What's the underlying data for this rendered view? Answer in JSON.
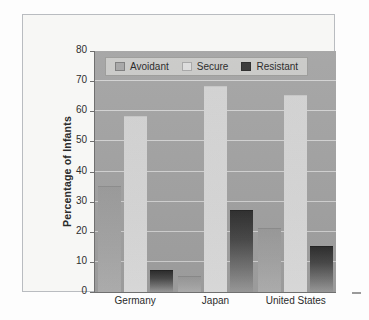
{
  "chart_data": {
    "type": "bar",
    "title": "",
    "subtitle": "",
    "xlabel": "",
    "ylabel": "Percentage of Infants",
    "categories": [
      "Germany",
      "Japan",
      "United States"
    ],
    "series": [
      {
        "name": "Avoidant",
        "values": [
          35,
          5,
          21
        ]
      },
      {
        "name": "Secure",
        "values": [
          58,
          68,
          65
        ]
      },
      {
        "name": "Resistant",
        "values": [
          7,
          27,
          15
        ]
      }
    ],
    "ylim": [
      0,
      80
    ],
    "ytick_labels": [
      "0",
      "10",
      "20",
      "30",
      "40",
      "50",
      "60",
      "70",
      "80"
    ],
    "ytick_values": [
      0,
      10,
      20,
      30,
      40,
      50,
      60,
      70,
      80
    ],
    "grid": true,
    "legend_position": "top-left-inside",
    "colors": {
      "avoidant": "#a5a5a5",
      "secure": "#dcdcdc",
      "resistant": "#353535",
      "plot_background": "#a3a3a3",
      "figure_background": "#f7f7f5",
      "gridline": "#dcdcdc",
      "axis": "#707070",
      "text": "#2b2b2b",
      "legend_background": "#c9c9c7"
    }
  },
  "legend": {
    "items": [
      {
        "label": "Avoidant",
        "key": "avoidant"
      },
      {
        "label": "Secure",
        "key": "secure"
      },
      {
        "label": "Resistant",
        "key": "resistant"
      }
    ]
  }
}
